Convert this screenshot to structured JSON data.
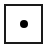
{
  "control": {
    "type": "checkbox-with-dot",
    "state": "selected",
    "icon": "dot-icon",
    "colors": {
      "border": "#1a1a1a",
      "dot": "#000000",
      "background": "#ffffff"
    }
  }
}
